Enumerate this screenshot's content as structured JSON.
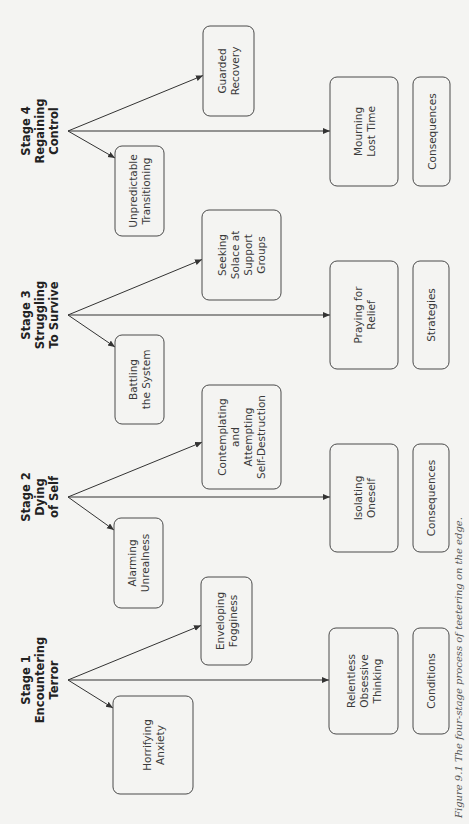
{
  "figure": {
    "caption": "Figure 9.1  The four-stage process of teetering on the edge.",
    "orientation": "rotated 90° counter-clockwise",
    "colors": {
      "background": "#f4f4f2",
      "stroke": "#4a4a4a",
      "text": "#3a3a3a"
    }
  },
  "stages": [
    {
      "title": [
        "Stage 1",
        "Encountering",
        "Terror"
      ],
      "branch_y": 680,
      "left_child": {
        "lines": [
          "Horrifying",
          "Anxiety"
        ],
        "box": [
          113,
          696,
          80,
          98
        ]
      },
      "upper_child": {
        "lines": [
          "Enveloping",
          "Fogginess"
        ],
        "box": [
          201,
          577,
          51,
          88
        ]
      },
      "right_child": {
        "lines": [
          "Relentless",
          "Obsessive",
          "Thinking"
        ],
        "box": [
          329,
          628,
          69,
          106
        ]
      },
      "category": {
        "label": "Conditions",
        "box": [
          413,
          628,
          36,
          106
        ]
      }
    },
    {
      "title": [
        "Stage 2",
        "Dying",
        "of Self"
      ],
      "branch_y": 497,
      "left_child": {
        "lines": [
          "Alarming",
          "Unrealness"
        ],
        "box": [
          114,
          518,
          49,
          90
        ]
      },
      "upper_child": {
        "lines": [
          "Contemplating",
          "and",
          "Attempting",
          "Self-Destruction"
        ],
        "box": [
          202,
          385,
          79,
          104
        ]
      },
      "right_child": {
        "lines": [
          "Isolating",
          "Oneself"
        ],
        "box": [
          330,
          444,
          68,
          108
        ]
      },
      "category": {
        "label": "Consequences",
        "box": [
          413,
          444,
          36,
          108
        ]
      }
    },
    {
      "title": [
        "Stage 3",
        "Struggling",
        "To Survive"
      ],
      "branch_y": 315,
      "left_child": {
        "lines": [
          "Battling",
          "the System"
        ],
        "box": [
          115,
          335,
          49,
          89
        ]
      },
      "upper_child": {
        "lines": [
          "Seeking",
          "Solace at",
          "Support",
          "Groups"
        ],
        "box": [
          202,
          210,
          79,
          90
        ]
      },
      "right_child": {
        "lines": [
          "Praying for",
          "Relief"
        ],
        "box": [
          330,
          261,
          68,
          108
        ]
      },
      "category": {
        "label": "Strategies",
        "box": [
          413,
          261,
          36,
          108
        ]
      }
    },
    {
      "title": [
        "Stage 4",
        "Regaining",
        "Control"
      ],
      "branch_y": 131,
      "left_child": {
        "lines": [
          "Unpredictable",
          "Transitioning"
        ],
        "box": [
          115,
          146,
          49,
          90
        ]
      },
      "upper_child": {
        "lines": [
          "Guarded",
          "Recovery"
        ],
        "box": [
          203,
          26,
          51,
          90
        ]
      },
      "right_child": {
        "lines": [
          "Mourning",
          "Lost Time"
        ],
        "box": [
          330,
          77,
          68,
          109
        ]
      },
      "category": {
        "label": "Consequences",
        "box": [
          413,
          77,
          37,
          109
        ]
      }
    }
  ]
}
